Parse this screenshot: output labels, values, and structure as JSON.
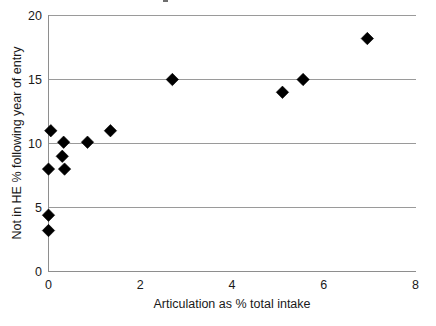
{
  "chart_data": {
    "type": "scatter",
    "title": "",
    "xlabel": "Articulation as % total intake",
    "ylabel": "Not in HE % following year of entry",
    "xlim": [
      0,
      8
    ],
    "ylim": [
      0,
      20
    ],
    "xticks": [
      "0",
      "2",
      "4",
      "6",
      "8"
    ],
    "xtick_values": [
      0,
      2,
      4,
      6,
      8
    ],
    "yticks": [
      "0",
      "5",
      "10",
      "15",
      "20"
    ],
    "ytick_values": [
      0,
      5,
      10,
      15,
      20
    ],
    "grid": "horizontal",
    "legend": "none",
    "marker": "filled-diamond",
    "marker_color": "#000000",
    "points": [
      {
        "x": 0.05,
        "y": 11.0
      },
      {
        "x": 0.0,
        "y": 8.0
      },
      {
        "x": 0.0,
        "y": 4.4
      },
      {
        "x": 0.0,
        "y": 3.2
      },
      {
        "x": 0.33,
        "y": 10.1
      },
      {
        "x": 0.3,
        "y": 9.0
      },
      {
        "x": 0.35,
        "y": 8.0
      },
      {
        "x": 0.85,
        "y": 10.1
      },
      {
        "x": 1.35,
        "y": 11.0
      },
      {
        "x": 2.7,
        "y": 15.0
      },
      {
        "x": 5.1,
        "y": 14.0
      },
      {
        "x": 5.55,
        "y": 15.0
      },
      {
        "x": 6.95,
        "y": 18.2
      }
    ]
  },
  "axes": {
    "x_label": "Articulation as % total intake",
    "y_label": "Not in HE % following year of entry",
    "x_tick_labels": [
      "0",
      "2",
      "4",
      "6",
      "8"
    ],
    "y_tick_labels": [
      "0",
      "5",
      "10",
      "15",
      "20"
    ]
  },
  "colors": {
    "marker": "#000000",
    "gridline": "#9a9a9a",
    "axis": "#8e8e8e",
    "text": "#1a1a1a",
    "background": "#ffffff"
  }
}
